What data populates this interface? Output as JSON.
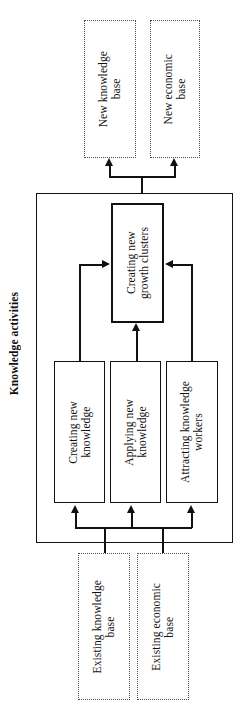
{
  "diagram": {
    "title": "Knowledge activities",
    "container_label": "knowledge-activities-container",
    "outputs": [
      {
        "id": "new-knowledge-base",
        "label": "New knowledge\nbase",
        "style": "dotted"
      },
      {
        "id": "new-economic-base",
        "label": "New economic\nbase",
        "style": "dotted"
      }
    ],
    "central": {
      "id": "creating-new-growth-clusters",
      "label": "Creating new\ngrowth clusters",
      "style": "solid-thick"
    },
    "activities": [
      {
        "id": "creating-new-knowledge",
        "label": "Creating new\nknowledge",
        "style": "solid"
      },
      {
        "id": "applying-new-knowledge",
        "label": "Applying new\nknowledge",
        "style": "solid"
      },
      {
        "id": "attracting-knowledge-workers",
        "label": "Attracting knowledge\nworkers",
        "style": "solid"
      }
    ],
    "inputs": [
      {
        "id": "existing-knowledge-base",
        "label": "Existing knowledge\nbase",
        "style": "dotted"
      },
      {
        "id": "existing-economic-base",
        "label": "Existing economic\nbase",
        "style": "dotted"
      }
    ],
    "colors": {
      "stroke": "#111111",
      "dotted_stroke": "#4a4a4a",
      "background": "#ffffff"
    },
    "orientation": "rotated-90-ccw",
    "flow": [
      "Existing knowledge base -> knowledge activities",
      "Existing economic base -> knowledge activities",
      "Creating new knowledge -> Creating new growth clusters",
      "Applying new knowledge -> Creating new growth clusters",
      "Attracting knowledge workers -> Creating new growth clusters",
      "Creating new growth clusters -> New knowledge base",
      "Creating new growth clusters -> New economic base"
    ]
  }
}
